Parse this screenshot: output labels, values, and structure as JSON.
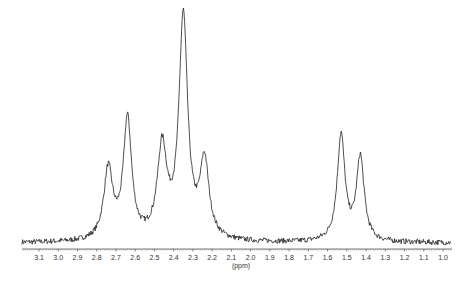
{
  "chart_data": {
    "type": "line",
    "title": "",
    "xlabel": "(ppm)",
    "ylabel": "",
    "xlim": [
      3.17,
      0.95
    ],
    "x_reversed": true,
    "xticks": [
      3.1,
      3.0,
      2.9,
      2.8,
      2.7,
      2.6,
      2.5,
      2.4,
      2.3,
      2.2,
      2.1,
      2.0,
      1.9,
      1.8,
      1.7,
      1.6,
      1.5,
      1.4,
      1.3,
      1.2,
      1.1,
      1.0
    ],
    "xtick_labels": [
      "3.1",
      "3.0",
      "2.9",
      "2.8",
      "2.7",
      "2.6",
      "2.5",
      "2.4",
      "2.3",
      "2.2",
      "2.1",
      "2.0",
      "1.9",
      "1.8",
      "1.7",
      "1.6",
      "1.5",
      "1.4",
      "1.3",
      "1.2",
      "1.1",
      "1.0"
    ],
    "grid": false,
    "legend": "none",
    "line_color": "#222222",
    "peaks": [
      {
        "ppm": 2.74,
        "intensity": 0.31,
        "width": 0.028
      },
      {
        "ppm": 2.64,
        "intensity": 0.53,
        "width": 0.026
      },
      {
        "ppm": 2.46,
        "intensity": 0.4,
        "width": 0.03
      },
      {
        "ppm": 2.35,
        "intensity": 0.98,
        "width": 0.027
      },
      {
        "ppm": 2.24,
        "intensity": 0.34,
        "width": 0.028
      },
      {
        "ppm": 1.53,
        "intensity": 0.47,
        "width": 0.024
      },
      {
        "ppm": 1.43,
        "intensity": 0.37,
        "width": 0.024
      }
    ],
    "noise_level": 0.012
  }
}
